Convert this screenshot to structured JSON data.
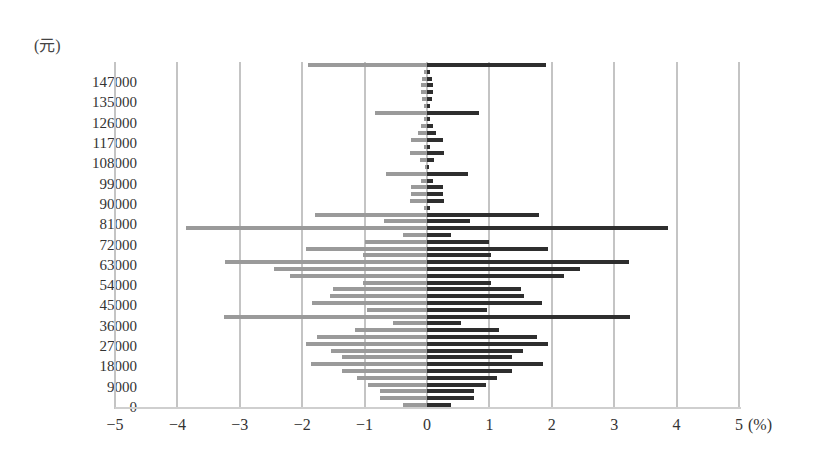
{
  "chart_data": {
    "type": "bar",
    "orientation": "horizontal-diverging",
    "title": "",
    "ylabel": "(元)",
    "xlabel": "(%)",
    "xlim": [
      -5,
      5
    ],
    "x_ticks": [
      "-5",
      "-4",
      "-3",
      "-2",
      "-1",
      "0",
      "1",
      "2",
      "3",
      "4",
      "5"
    ],
    "y_tick_labels": [
      "147000",
      "135000",
      "126000",
      "117000",
      "108000",
      "99000",
      "90000",
      "81000",
      "72000",
      "63000",
      "54000",
      "45000",
      "36000",
      "27000",
      "18000",
      "9000",
      "0"
    ],
    "grid": "vertical",
    "legend": "none",
    "bin_width_yuan": 3000,
    "colors": {
      "left": "#9a9a9a",
      "right": "#2e2e2e",
      "grid": "#c4c4c4"
    },
    "series": [
      {
        "name": "left (mirrored, negative)",
        "values": [
          -0.39,
          -0.75,
          -0.75,
          -0.94,
          -1.12,
          -1.36,
          -1.86,
          -1.37,
          -1.54,
          -1.94,
          -1.77,
          -1.15,
          -0.54,
          -3.25,
          -0.96,
          -1.85,
          -1.56,
          -1.5,
          -1.03,
          -2.2,
          -2.45,
          -3.23,
          -1.03,
          -1.94,
          -0.99,
          -0.39,
          -3.87,
          -0.69,
          -1.8,
          -0.05,
          -0.28,
          -0.25,
          -0.25,
          -0.1,
          -0.65,
          -0.03,
          -0.12,
          -0.27,
          -0.05,
          -0.25,
          -0.15,
          -0.1,
          -0.05,
          -0.84,
          -0.05,
          -0.08,
          -0.1,
          -0.1,
          -0.08,
          -0.05,
          -1.9
        ]
      },
      {
        "name": "right (positive)",
        "values": [
          0.39,
          0.75,
          0.75,
          0.94,
          1.12,
          1.36,
          1.86,
          1.37,
          1.54,
          1.94,
          1.77,
          1.15,
          0.54,
          3.25,
          0.96,
          1.85,
          1.56,
          1.5,
          1.03,
          2.2,
          2.45,
          3.23,
          1.03,
          1.94,
          0.99,
          0.39,
          3.87,
          0.69,
          1.8,
          0.05,
          0.28,
          0.25,
          0.25,
          0.1,
          0.65,
          0.03,
          0.12,
          0.27,
          0.05,
          0.25,
          0.15,
          0.1,
          0.05,
          0.84,
          0.05,
          0.08,
          0.1,
          0.1,
          0.08,
          0.05,
          1.9
        ]
      }
    ],
    "categories_note": "bars ordered bottom (0 元) to top (>147000 元), ~3000 元 per bar"
  }
}
